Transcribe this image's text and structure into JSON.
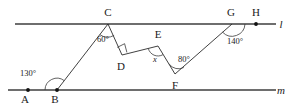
{
  "figure": {
    "lines": [
      {
        "name": "l",
        "label": "l",
        "y": 24,
        "x1": 15,
        "x2": 276
      },
      {
        "name": "m",
        "label": "m",
        "y": 90,
        "x1": 8,
        "x2": 276
      }
    ],
    "points": [
      {
        "id": "A",
        "label": "A",
        "x": 28,
        "y": 90,
        "label_x": 25,
        "label_y": 103,
        "dot": true
      },
      {
        "id": "B",
        "label": "B",
        "x": 57,
        "y": 90,
        "label_x": 53,
        "label_y": 103,
        "dot": true
      },
      {
        "id": "C",
        "label": "C",
        "x": 108,
        "y": 24,
        "label_x": 104,
        "label_y": 16,
        "dot": false
      },
      {
        "id": "D",
        "label": "D",
        "x": 122,
        "y": 55,
        "label_x": 118,
        "label_y": 70,
        "dot": false
      },
      {
        "id": "E",
        "label": "E",
        "x": 158,
        "y": 46,
        "label_x": 154,
        "label_y": 38,
        "dot": false
      },
      {
        "id": "F",
        "label": "F",
        "x": 175,
        "y": 74,
        "label_x": 171,
        "label_y": 89,
        "dot": false
      },
      {
        "id": "G",
        "label": "G",
        "x": 232,
        "y": 24,
        "label_x": 228,
        "label_y": 16,
        "dot": false
      },
      {
        "id": "H",
        "label": "H",
        "x": 256,
        "y": 24,
        "label_x": 252,
        "label_y": 16,
        "dot": true
      }
    ],
    "segments": [
      {
        "from": "B",
        "to": "C"
      },
      {
        "from": "C",
        "to": "D"
      },
      {
        "from": "D",
        "to": "E"
      },
      {
        "from": "E",
        "to": "F"
      },
      {
        "from": "F",
        "to": "G"
      }
    ],
    "angles": [
      {
        "id": "angle-B",
        "vertex": "B",
        "value": "130",
        "unit": "°",
        "label": "130°",
        "label_x": 28,
        "label_y": 76,
        "type": "arc"
      },
      {
        "id": "angle-C",
        "vertex": "C",
        "value": "60",
        "unit": "°",
        "label": "60°",
        "label_x": 101,
        "label_y": 41,
        "type": "arc"
      },
      {
        "id": "angle-D",
        "vertex": "D",
        "value": "90",
        "unit": "°",
        "label": "",
        "label_x": 0,
        "label_y": 0,
        "type": "right-angle"
      },
      {
        "id": "angle-E",
        "vertex": "E",
        "value": "x",
        "unit": "",
        "label": "x",
        "label_x": 154,
        "label_y": 61,
        "type": "arc-variable"
      },
      {
        "id": "angle-F",
        "vertex": "F",
        "value": "80",
        "unit": "°",
        "label": "80°",
        "label_x": 180,
        "label_y": 62,
        "type": "arc"
      },
      {
        "id": "angle-G",
        "vertex": "G",
        "value": "140",
        "unit": "°",
        "label": "140°",
        "label_x": 226,
        "label_y": 44,
        "type": "arc"
      }
    ],
    "colors": {
      "parallel_line": "#6e6e6e",
      "segment": "#2b2b2b",
      "text": "#1a1a1a",
      "background": "#ffffff"
    }
  }
}
